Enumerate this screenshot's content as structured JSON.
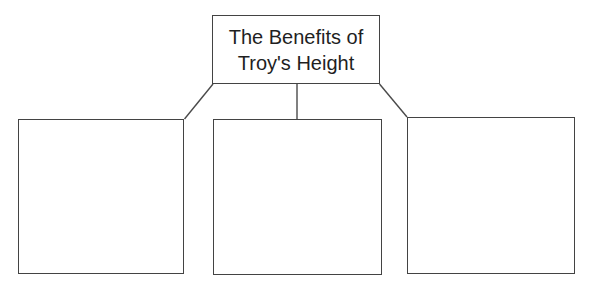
{
  "diagram": {
    "title": "The Benefits of Troy's Height",
    "boxes": [
      {
        "position": "left",
        "text": ""
      },
      {
        "position": "middle",
        "text": ""
      },
      {
        "position": "right",
        "text": ""
      }
    ],
    "colors": {
      "border": "#434343",
      "connector": "#4a4a4a",
      "title_text": "#1f1f1f",
      "background": "#ffffff"
    }
  }
}
